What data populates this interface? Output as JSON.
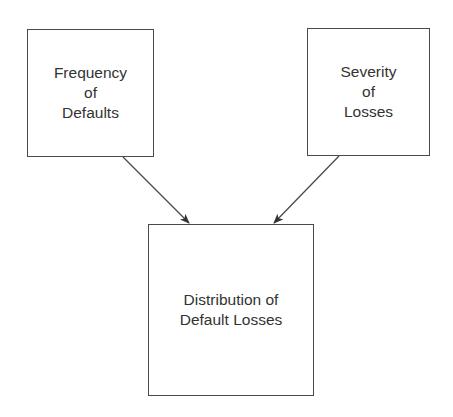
{
  "diagram": {
    "type": "flow",
    "nodes": [
      {
        "id": "frequency",
        "lines": [
          "Frequency",
          "of",
          "Defaults"
        ]
      },
      {
        "id": "severity",
        "lines": [
          "Severity",
          "of",
          "Losses"
        ]
      },
      {
        "id": "distribution",
        "lines": [
          "Distribution of",
          "Default Losses"
        ]
      }
    ],
    "edges": [
      {
        "from": "frequency",
        "to": "distribution"
      },
      {
        "from": "severity",
        "to": "distribution"
      }
    ],
    "colors": {
      "stroke": "#4a4a4a",
      "text": "#333333",
      "background": "#ffffff"
    }
  }
}
